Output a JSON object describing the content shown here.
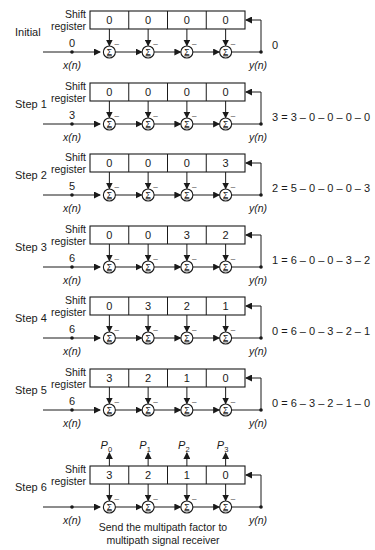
{
  "diagram": {
    "register_label_line1": "Shift",
    "register_label_line2": "register",
    "input_label": "x(n)",
    "output_label": "y(n)",
    "sum_symbol": "Σ",
    "minus_symbol": "–",
    "colors": {
      "stroke": "#1a1a1a",
      "background": "#ffffff"
    },
    "steps": [
      {
        "label": "Initial",
        "input": "0",
        "register": [
          "0",
          "0",
          "0",
          "0"
        ],
        "equation": "0"
      },
      {
        "label": "Step 1",
        "input": "3",
        "register": [
          "0",
          "0",
          "0",
          "0"
        ],
        "equation": "3 = 3 – 0 – 0 – 0 – 0"
      },
      {
        "label": "Step 2",
        "input": "5",
        "register": [
          "0",
          "0",
          "0",
          "3"
        ],
        "equation": "2 = 5 – 0 – 0 – 0 – 3"
      },
      {
        "label": "Step 3",
        "input": "6",
        "register": [
          "0",
          "0",
          "3",
          "2"
        ],
        "equation": "1 = 6 – 0 – 0 – 3 – 2"
      },
      {
        "label": "Step 4",
        "input": "6",
        "register": [
          "0",
          "3",
          "2",
          "1"
        ],
        "equation": "0 = 6 – 0 – 3 – 2 – 1"
      },
      {
        "label": "Step 5",
        "input": "6",
        "register": [
          "3",
          "2",
          "1",
          "0"
        ],
        "equation": "0 = 6 – 3 – 2 – 1 – 0"
      },
      {
        "label": "Step 6",
        "input": "",
        "register": [
          "3",
          "2",
          "1",
          "0"
        ],
        "equation": ""
      }
    ],
    "outputs": [
      {
        "letter": "P",
        "sub": "0"
      },
      {
        "letter": "P",
        "sub": "1"
      },
      {
        "letter": "P",
        "sub": "2"
      },
      {
        "letter": "P",
        "sub": "3"
      }
    ],
    "caption_line1": "Send the multipath factor to",
    "caption_line2": "multipath signal receiver"
  }
}
